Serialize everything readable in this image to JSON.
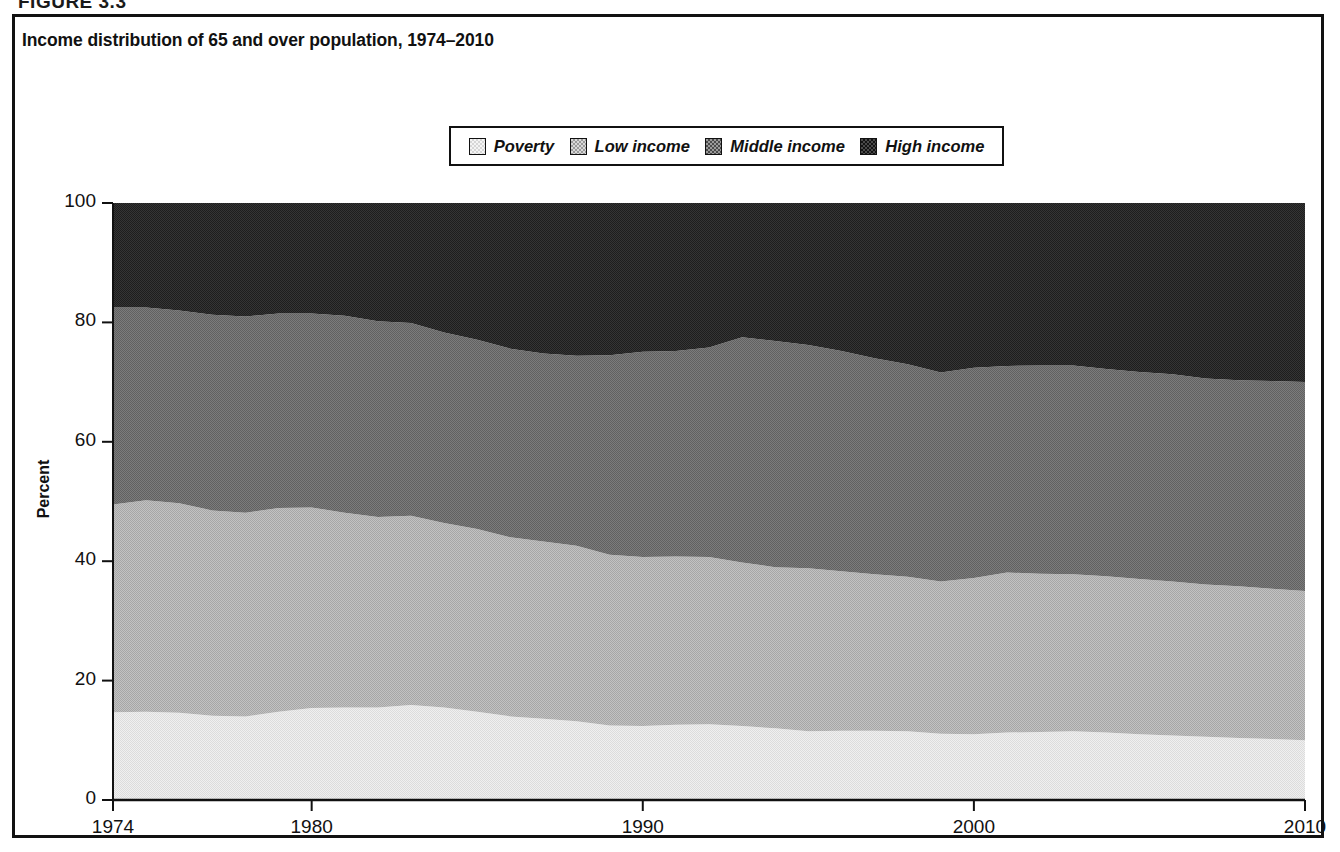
{
  "figure": {
    "number_label": "FIGURE 3.3",
    "title": "Income distribution of 65 and over population, 1974–2010"
  },
  "legend": {
    "position": "top-center",
    "items": [
      {
        "label": "Poverty",
        "icon": "swatch-poverty",
        "color": "#e8e8e8"
      },
      {
        "label": "Low income",
        "icon": "swatch-low-income",
        "color": "#b4b4b4"
      },
      {
        "label": "Middle income",
        "icon": "swatch-middle-income",
        "color": "#6e6e6e"
      },
      {
        "label": "High income",
        "icon": "swatch-high-income",
        "color": "#2a2a2a"
      }
    ]
  },
  "axes": {
    "ylabel": "Percent",
    "yticks": [
      "0",
      "20",
      "40",
      "60",
      "80",
      "100"
    ],
    "xticks": [
      "1974",
      "1980",
      "1990",
      "2000",
      "2010"
    ],
    "xlabel": ""
  },
  "chart_data": {
    "type": "area",
    "title": "Income distribution of 65 and over population, 1974–2010",
    "xlabel": "",
    "ylabel": "Percent",
    "ylim": [
      0,
      100
    ],
    "xlim": [
      1974,
      2010
    ],
    "yticks": [
      0,
      20,
      40,
      60,
      80,
      100
    ],
    "xticks": [
      1974,
      1980,
      1990,
      2000,
      2010
    ],
    "grid": false,
    "legend_position": "top-center",
    "stacked": true,
    "stack_order_bottom_to_top": [
      "Poverty",
      "Low income",
      "Middle income",
      "High income"
    ],
    "x": [
      1974,
      1975,
      1976,
      1977,
      1978,
      1979,
      1980,
      1981,
      1982,
      1983,
      1984,
      1985,
      1986,
      1987,
      1988,
      1989,
      1990,
      1991,
      1992,
      1993,
      1994,
      1995,
      1996,
      1997,
      1998,
      1999,
      2000,
      2001,
      2002,
      2003,
      2004,
      2005,
      2006,
      2007,
      2008,
      2009,
      2010
    ],
    "series": [
      {
        "name": "Poverty",
        "color": "#e8e8e8",
        "values": [
          14.7,
          14.8,
          14.6,
          14.1,
          14.0,
          14.8,
          15.4,
          15.5,
          15.5,
          15.9,
          15.5,
          14.8,
          14.0,
          13.6,
          13.2,
          12.5,
          12.4,
          12.6,
          12.7,
          12.4,
          12.0,
          11.5,
          11.6,
          11.6,
          11.5,
          11.1,
          11.0,
          11.3,
          11.4,
          11.5,
          11.3,
          11.0,
          10.8,
          10.6,
          10.4,
          10.2,
          10.0
        ]
      },
      {
        "name": "Low income",
        "color": "#b4b4b4",
        "values": [
          34.8,
          35.4,
          35.1,
          34.4,
          34.1,
          34.1,
          33.6,
          32.6,
          31.9,
          31.7,
          30.9,
          30.6,
          30.0,
          29.7,
          29.4,
          28.6,
          28.3,
          28.2,
          28.0,
          27.4,
          27.0,
          27.3,
          26.7,
          26.2,
          25.9,
          25.5,
          26.2,
          26.8,
          26.5,
          26.3,
          26.2,
          26.0,
          25.8,
          25.5,
          25.4,
          25.2,
          25.0
        ]
      },
      {
        "name": "Middle income",
        "color": "#6e6e6e",
        "values": [
          33.0,
          32.3,
          32.3,
          32.8,
          32.9,
          32.6,
          32.5,
          33.0,
          32.8,
          32.3,
          31.9,
          31.7,
          31.6,
          31.5,
          31.8,
          33.4,
          34.4,
          34.4,
          35.1,
          37.7,
          37.9,
          37.4,
          36.9,
          36.2,
          35.6,
          35.0,
          35.2,
          34.6,
          34.9,
          35.0,
          34.7,
          34.7,
          34.7,
          34.5,
          34.5,
          34.8,
          35.0
        ]
      },
      {
        "name": "High income",
        "color": "#2a2a2a",
        "values": [
          17.5,
          17.5,
          18.0,
          18.7,
          19.0,
          18.5,
          18.5,
          18.9,
          19.8,
          20.1,
          21.7,
          22.9,
          24.4,
          25.2,
          25.6,
          25.5,
          24.9,
          24.8,
          24.2,
          22.5,
          23.1,
          23.8,
          24.8,
          26.0,
          27.0,
          28.4,
          27.6,
          27.3,
          27.2,
          27.2,
          27.8,
          28.3,
          28.7,
          29.4,
          29.7,
          29.8,
          30.0
        ]
      }
    ],
    "cumulative_upper_boundaries": {
      "poverty_top": [
        14.7,
        14.8,
        14.6,
        14.1,
        14.0,
        14.8,
        15.4,
        15.5,
        15.5,
        15.9,
        15.5,
        14.8,
        14.0,
        13.6,
        13.2,
        12.5,
        12.4,
        12.6,
        12.7,
        12.4,
        12.0,
        11.5,
        11.6,
        11.6,
        11.5,
        11.1,
        11.0,
        11.3,
        11.4,
        11.5,
        11.3,
        11.0,
        10.8,
        10.6,
        10.4,
        10.2,
        10.0
      ],
      "low_income_top": [
        49.5,
        50.2,
        49.7,
        48.5,
        48.1,
        48.9,
        49.0,
        48.1,
        47.4,
        47.6,
        46.4,
        45.4,
        44.0,
        43.3,
        42.6,
        41.1,
        40.7,
        40.8,
        40.7,
        39.8,
        39.0,
        38.8,
        38.3,
        37.8,
        37.4,
        36.6,
        37.2,
        38.1,
        37.9,
        37.8,
        37.5,
        37.0,
        36.6,
        36.1,
        35.8,
        35.4,
        35.0
      ],
      "middle_income_top": [
        82.5,
        82.5,
        82.0,
        81.3,
        81.0,
        81.5,
        81.5,
        81.1,
        80.2,
        79.9,
        78.3,
        77.1,
        75.6,
        74.8,
        74.4,
        74.5,
        75.1,
        75.2,
        75.8,
        77.5,
        76.9,
        76.2,
        75.2,
        74.0,
        73.0,
        71.6,
        72.4,
        72.7,
        72.8,
        72.8,
        72.2,
        71.7,
        71.3,
        70.6,
        70.3,
        70.2,
        70.0
      ],
      "high_income_top": [
        100,
        100,
        100,
        100,
        100,
        100,
        100,
        100,
        100,
        100,
        100,
        100,
        100,
        100,
        100,
        100,
        100,
        100,
        100,
        100,
        100,
        100,
        100,
        100,
        100,
        100,
        100,
        100,
        100,
        100,
        100,
        100,
        100,
        100,
        100,
        100,
        100
      ]
    }
  }
}
